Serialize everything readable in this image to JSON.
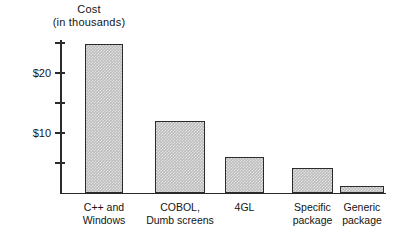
{
  "chart_data": {
    "type": "bar",
    "title": "Cost (in thousands)",
    "title_lines": [
      "Cost",
      "(in thousands)"
    ],
    "xlabel": "",
    "ylabel": "Cost (in thousands)",
    "ylim": [
      0,
      27
    ],
    "grid": false,
    "legend": null,
    "y_ticks": [
      5,
      10,
      15,
      20,
      25
    ],
    "y_tick_labels": [
      "",
      "$10",
      "",
      "$20",
      ""
    ],
    "categories": [
      "C++ and Windows",
      "COBOL, Dumb screens",
      "4GL",
      "Specific package",
      "Generic package"
    ],
    "category_lines": [
      [
        "C++ and",
        "Windows"
      ],
      [
        "COBOL,",
        "Dumb screens"
      ],
      [
        "4GL",
        ""
      ],
      [
        "Specific",
        "package"
      ],
      [
        "Generic",
        "package"
      ]
    ],
    "values": [
      24.8,
      12.0,
      6.0,
      4.2,
      1.2
    ],
    "colors": {
      "bar_fill": "#bcbcbc",
      "bar_border": "#2b2b2b",
      "axis": "#2b2b2b",
      "text": "#141414",
      "background": "#ffffff"
    }
  }
}
